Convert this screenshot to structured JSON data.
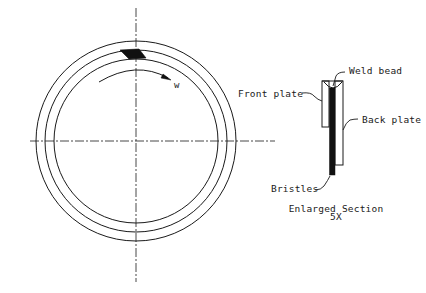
{
  "diagram": {
    "colors": {
      "line": "#1a1a1a",
      "background": "#ffffff"
    },
    "ring_view": {
      "center": [
        136,
        141
      ],
      "radii": {
        "outer": 100,
        "middle": 91,
        "inner": 82
      },
      "centerlines": {
        "horizontal": [
          30,
          275
        ],
        "vertical": [
          8,
          282
        ]
      },
      "rotation_label": "w"
    },
    "section_view": {
      "labels": {
        "weld_bead": "Weld bead",
        "front_plate": "Front plate",
        "back_plate": "Back plate",
        "bristles": "Bristles"
      },
      "caption": {
        "title": "Enlarged Section",
        "scale": "5X"
      }
    }
  }
}
